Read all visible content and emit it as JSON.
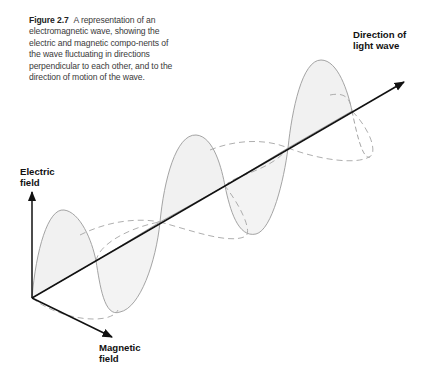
{
  "caption": {
    "figure_label": "Figure 2.7",
    "text": "A representation of an electromagnetic wave, showing the electric and magnetic compo-nents of the wave fluctuating in directions perpendicular to each other, and to the direction of motion of the wave."
  },
  "labels": {
    "direction_line1": "Direction of",
    "direction_line2": "light wave",
    "electric_line1": "Electric",
    "electric_line2": "field",
    "magnetic_line1": "Magnetic",
    "magnetic_line2": "field"
  },
  "colors": {
    "axis": "#111111",
    "wave_stroke": "#9a9a9a",
    "wave_fill": "#f1f1f1"
  }
}
